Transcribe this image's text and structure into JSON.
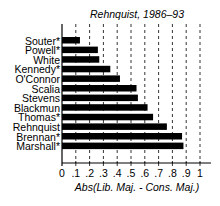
{
  "chart_data": {
    "type": "bar",
    "orientation": "horizontal",
    "title": "Rehnquist, 1986–93",
    "xlabel": "Abs(Lib. Maj. - Cons. Maj.)",
    "ylabel": "",
    "xlim": [
      0,
      1
    ],
    "xticks": [
      "0",
      ".1",
      ".2",
      ".3",
      ".4",
      ".5",
      ".6",
      ".7",
      ".8",
      ".9",
      "1"
    ],
    "grid": "vertical dashed",
    "categories": [
      "Souter*",
      "Powell*",
      "White",
      "Kennedy*",
      "O'Connor",
      "Scalia",
      "Stevens",
      "Blackmun",
      "Thomas*",
      "Rehnquist",
      "Brennan*",
      "Marshall*"
    ],
    "values": [
      0.13,
      0.26,
      0.27,
      0.35,
      0.42,
      0.54,
      0.55,
      0.62,
      0.66,
      0.76,
      0.87,
      0.88
    ],
    "bar_color": "#000000"
  }
}
